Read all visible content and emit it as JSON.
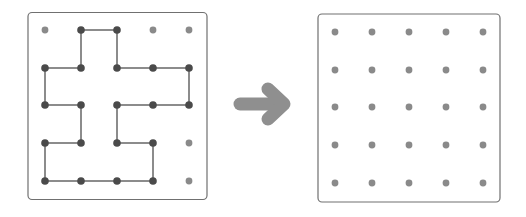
{
  "diagram": {
    "colors": {
      "border": "#707070",
      "dot_plain": "#8a8a8a",
      "dot_active": "#4a4a4a",
      "line": "#8c8c8c",
      "arrow": "#8f8f8f"
    },
    "left_grid": {
      "rows": 5,
      "cols": 5,
      "path_cols_rows": [
        [
          1,
          0
        ],
        [
          2,
          0
        ],
        [
          2,
          1
        ],
        [
          3,
          1
        ],
        [
          4,
          1
        ],
        [
          4,
          2
        ],
        [
          3,
          2
        ],
        [
          2,
          2
        ],
        [
          2,
          3
        ],
        [
          3,
          3
        ],
        [
          3,
          4
        ],
        [
          2,
          4
        ],
        [
          1,
          4
        ],
        [
          0,
          4
        ],
        [
          0,
          3
        ],
        [
          1,
          3
        ],
        [
          1,
          2
        ],
        [
          0,
          2
        ],
        [
          0,
          1
        ],
        [
          1,
          1
        ],
        [
          1,
          0
        ]
      ]
    },
    "arrow": {
      "direction": "right"
    },
    "right_grid": {
      "rows": 5,
      "cols": 5
    }
  }
}
